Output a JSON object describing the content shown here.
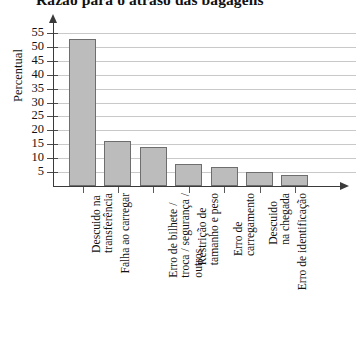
{
  "chart_data": {
    "type": "bar",
    "title": "Razão para o atraso das bagagens",
    "xlabel": "",
    "ylabel": "Percentual",
    "ylim": [
      0,
      57
    ],
    "grid": true,
    "legend": "none",
    "yticks": [
      55,
      50,
      45,
      40,
      35,
      30,
      25,
      20,
      15,
      10,
      5
    ],
    "categories": [
      "Descuido na transferência",
      "Falha ao carregar",
      "Erro de bilhete / troca / segurança / outros",
      "Restrição de tamanho e peso",
      "Erro de carregamento",
      "Descuido na chegada",
      "Erro de identificação"
    ],
    "category_lines": [
      [
        "Descuido na",
        "transferência"
      ],
      [
        "Falha ao carregar"
      ],
      [
        "Erro de bilhete /",
        "troca / segurança /",
        "outros"
      ],
      [
        "Restrição de",
        "tamanho e peso"
      ],
      [
        "Erro de",
        "carregamento"
      ],
      [
        "Descuido",
        "na chegada"
      ],
      [
        "Erro de identificação"
      ]
    ],
    "values": [
      53,
      16,
      14,
      8,
      7,
      5,
      4
    ],
    "bar_fill_color": "#bcbcbc",
    "bar_border_color": "#6e6e6e",
    "gridline_color": "#c9c9c9",
    "axis_color": "#3a3a3a"
  }
}
